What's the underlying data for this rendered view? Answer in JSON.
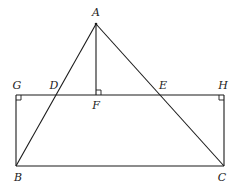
{
  "diagram": {
    "type": "geometry",
    "points": {
      "A": {
        "label": "A",
        "x": 96,
        "y": 24,
        "lx": 96,
        "ly": 16
      },
      "B": {
        "label": "B",
        "x": 16,
        "y": 166,
        "lx": 18,
        "ly": 180
      },
      "C": {
        "label": "C",
        "x": 224,
        "y": 166,
        "lx": 222,
        "ly": 180
      },
      "D": {
        "label": "D",
        "x": 55,
        "y": 95,
        "lx": 54,
        "ly": 88
      },
      "E": {
        "label": "E",
        "x": 161,
        "y": 95,
        "lx": 163,
        "ly": 88
      },
      "F": {
        "label": "F",
        "x": 96,
        "y": 95,
        "lx": 96,
        "ly": 108
      },
      "G": {
        "label": "G",
        "x": 16,
        "y": 95,
        "lx": 17,
        "ly": 88
      },
      "H": {
        "label": "H",
        "x": 224,
        "y": 95,
        "lx": 223,
        "ly": 88
      }
    },
    "segments": [
      "AB",
      "AC",
      "AF",
      "GH",
      "BC",
      "GB",
      "HC"
    ],
    "right_angles": [
      "G",
      "H",
      "F"
    ],
    "stroke_color": "#1a1a1a",
    "background": "#ffffff"
  }
}
